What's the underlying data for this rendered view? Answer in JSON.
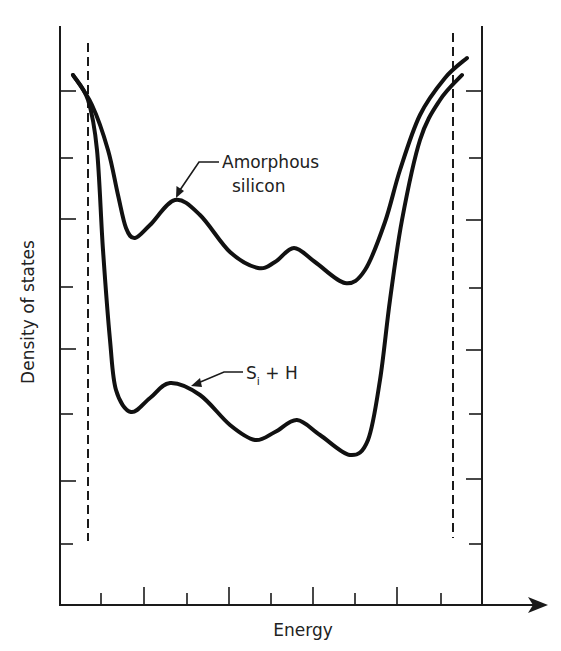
{
  "figure": {
    "xlabel": "Energy",
    "ylabel": "Density of states",
    "annotations": {
      "amorphous": {
        "line1": "Amorphous",
        "line2": "silicon"
      },
      "hydrogenated": {
        "main": "S",
        "subscript": "i",
        "rest": " + H"
      }
    }
  },
  "chart_data": {
    "type": "line",
    "title": "",
    "xlabel": "Energy",
    "ylabel": "Density of states",
    "grid": false,
    "legend": "inline annotations with leader arrows",
    "x_ticks_count": 10,
    "y_ticks_count": 8,
    "tick_labels": [],
    "band_edges": {
      "description": "vertical dashed lines marking band edges",
      "left_x_relative": 0.07,
      "right_x_relative": 0.93
    },
    "axes_px": {
      "x0": 60,
      "x1": 482,
      "y_top": 26,
      "y_axis": 605,
      "arrow_end": 548
    },
    "series": [
      {
        "name": "Amorphous silicon",
        "shape": "high gap states: U-shaped with ripples, min near mid-gap",
        "points_px": [
          [
            73,
            75
          ],
          [
            92,
            105
          ],
          [
            108,
            150
          ],
          [
            118,
            195
          ],
          [
            126,
            228
          ],
          [
            135,
            238
          ],
          [
            150,
            225
          ],
          [
            175,
            200
          ],
          [
            200,
            215
          ],
          [
            230,
            252
          ],
          [
            258,
            268
          ],
          [
            275,
            262
          ],
          [
            294,
            248
          ],
          [
            315,
            262
          ],
          [
            345,
            283
          ],
          [
            365,
            270
          ],
          [
            385,
            222
          ],
          [
            400,
            170
          ],
          [
            420,
            115
          ],
          [
            445,
            78
          ],
          [
            467,
            58
          ]
        ]
      },
      {
        "name": "Si + H",
        "shape": "reduced gap states: deeper U with ripples",
        "points_px": [
          [
            73,
            75
          ],
          [
            88,
            100
          ],
          [
            97,
            150
          ],
          [
            103,
            250
          ],
          [
            110,
            340
          ],
          [
            116,
            390
          ],
          [
            131,
            412
          ],
          [
            150,
            398
          ],
          [
            170,
            383
          ],
          [
            200,
            395
          ],
          [
            230,
            425
          ],
          [
            255,
            440
          ],
          [
            275,
            432
          ],
          [
            297,
            420
          ],
          [
            320,
            435
          ],
          [
            350,
            455
          ],
          [
            368,
            440
          ],
          [
            380,
            380
          ],
          [
            390,
            300
          ],
          [
            402,
            220
          ],
          [
            420,
            140
          ],
          [
            440,
            100
          ],
          [
            462,
            75
          ]
        ]
      }
    ]
  }
}
